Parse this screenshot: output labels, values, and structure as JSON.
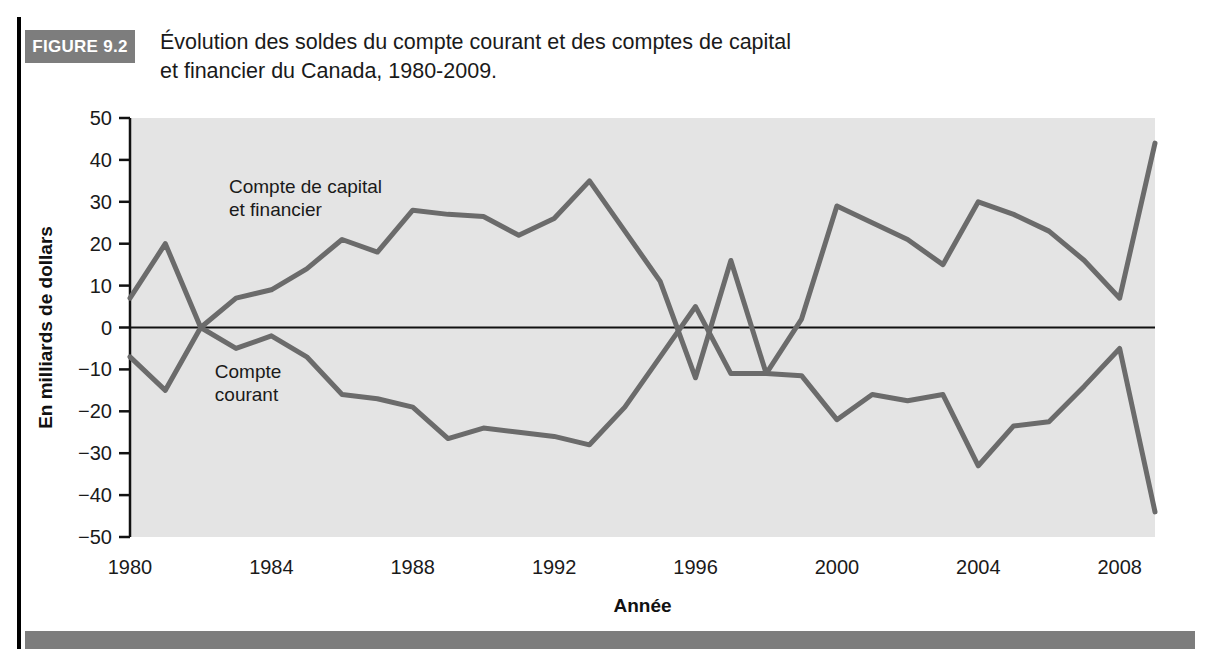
{
  "figure": {
    "badge_label": "FIGURE 9.2",
    "title_line_1": "Évolution des soldes du compte courant et des comptes de capital",
    "title_line_2": "et financier du Canada, 1980-2009."
  },
  "colors": {
    "badge_background": "#7d7d7d",
    "plot_background": "#e4e4e4",
    "series_line": "#6b6b6b",
    "zero_line": "#111111",
    "axis": "#111111",
    "text": "#1a1a1a"
  },
  "chart_data": {
    "type": "line",
    "title": "Évolution des soldes du compte courant et des comptes de capital et financier du Canada, 1980-2009.",
    "xlabel": "Année",
    "ylabel": "En milliards de dollars",
    "xlim": [
      1980,
      2009
    ],
    "ylim": [
      -50,
      50
    ],
    "ytick_labels": [
      "50",
      "40",
      "30",
      "20",
      "10",
      "0",
      "−10",
      "−20",
      "−30",
      "−40",
      "−50"
    ],
    "ytick_values": [
      50,
      40,
      30,
      20,
      10,
      0,
      -10,
      -20,
      -30,
      -40,
      -50
    ],
    "xtick_labels": [
      "1980",
      "1984",
      "1988",
      "1992",
      "1996",
      "2000",
      "2004",
      "2008"
    ],
    "xtick_values": [
      1980,
      1984,
      1988,
      1992,
      1996,
      2000,
      2004,
      2008
    ],
    "grid": false,
    "legend": "annotations-on-plot",
    "x": [
      1980,
      1981,
      1982,
      1983,
      1984,
      1985,
      1986,
      1987,
      1988,
      1989,
      1990,
      1991,
      1992,
      1993,
      1994,
      1995,
      1996,
      1997,
      1998,
      1999,
      2000,
      2001,
      2002,
      2003,
      2004,
      2005,
      2006,
      2007,
      2008,
      2009
    ],
    "series": [
      {
        "name": "Compte de capital et financier",
        "label_line_1": "Compte de capital",
        "label_line_2": "et financier",
        "values": [
          7,
          20,
          0,
          7,
          9,
          14,
          21,
          18,
          28,
          27,
          26.5,
          22,
          26,
          35,
          23,
          11,
          -12,
          16,
          -11,
          -11.5,
          -22,
          -16,
          -17.5,
          -16,
          -33,
          -23.5,
          -22.5,
          -14,
          -5,
          -44
        ]
      },
      {
        "name": "Compte courant",
        "label_line_1": "Compte",
        "label_line_2": "courant",
        "values": [
          -7,
          -15,
          0,
          -5,
          -2,
          -7,
          -16,
          -17,
          -19,
          -26.5,
          -24,
          -25,
          -26,
          -28,
          -19,
          -7,
          5,
          -11,
          -11,
          2,
          29,
          25,
          21,
          15,
          30,
          27,
          23,
          16,
          7,
          44
        ]
      }
    ],
    "annotations": [
      {
        "text": "Compte de capital",
        "x": 1982.8,
        "y": 32
      },
      {
        "text": "et financier",
        "x": 1982.8,
        "y": 26.5
      },
      {
        "text": "Compte",
        "x": 1982.4,
        "y": -12
      },
      {
        "text": "courant",
        "x": 1982.4,
        "y": -17.5
      }
    ]
  }
}
